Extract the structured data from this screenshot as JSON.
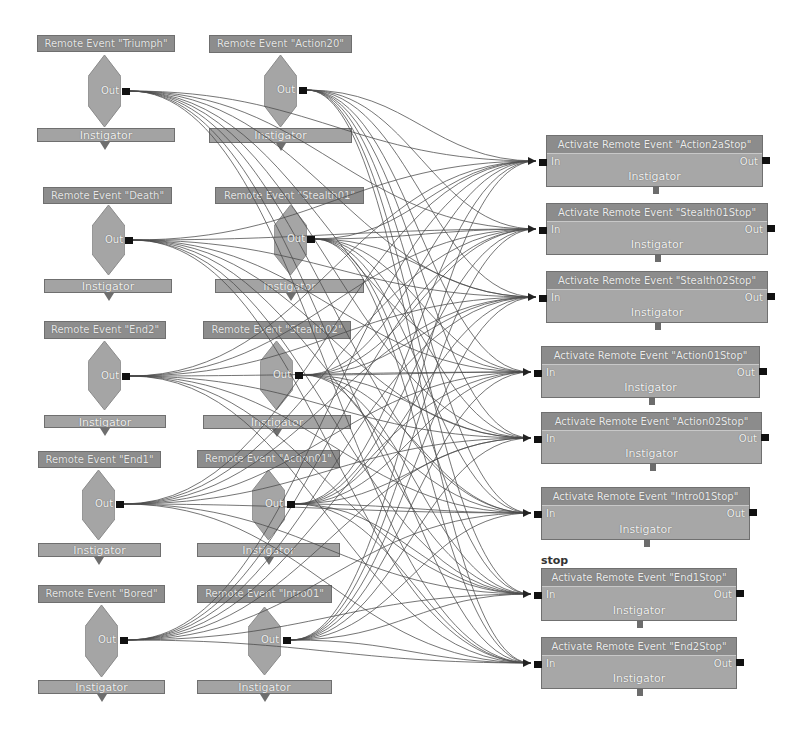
{
  "graph": {
    "source_nodes": [
      {
        "id": "triumph",
        "title": "Remote Event \"Triumph\"",
        "out_label": "Out",
        "instigator_label": "Instigator",
        "title_box": [
          37,
          35,
          138,
          17
        ],
        "inst_box": [
          37,
          128,
          138,
          14
        ],
        "diamond": [
          88,
          55,
          33,
          72
        ],
        "port": [
          122,
          88
        ]
      },
      {
        "id": "action20",
        "title": "Remote Event \"Action20\"",
        "out_label": "Out",
        "instigator_label": "Instigator",
        "title_box": [
          209,
          35,
          143,
          18
        ],
        "inst_box": [
          209,
          128,
          143,
          15
        ],
        "diamond": [
          264,
          55,
          33,
          72
        ],
        "port": [
          299,
          87
        ]
      },
      {
        "id": "death",
        "title": "Remote Event \"Death\"",
        "out_label": "Out",
        "instigator_label": "Instigator",
        "title_box": [
          43,
          187,
          129,
          17
        ],
        "inst_box": [
          44,
          279,
          128,
          14
        ],
        "diamond": [
          92,
          205,
          33,
          70
        ],
        "port": [
          125,
          237
        ]
      },
      {
        "id": "stealth01",
        "title": "Remote Event \"Stealth01\"",
        "out_label": "Out",
        "instigator_label": "Instigator",
        "title_box": [
          215,
          187,
          149,
          17
        ],
        "inst_box": [
          215,
          279,
          149,
          14
        ],
        "diamond": [
          274,
          205,
          33,
          70
        ],
        "port": [
          307,
          236
        ]
      },
      {
        "id": "end2",
        "title": "Remote Event \"End2\"",
        "out_label": "Out",
        "instigator_label": "Instigator",
        "title_box": [
          44,
          321,
          122,
          18
        ],
        "inst_box": [
          44,
          415,
          122,
          13
        ],
        "diamond": [
          88,
          341,
          33,
          69
        ],
        "port": [
          122,
          373
        ]
      },
      {
        "id": "stealth02",
        "title": "Remote Event \"Stealth02\"",
        "out_label": "Out",
        "instigator_label": "Instigator",
        "title_box": [
          203,
          321,
          148,
          18
        ],
        "inst_box": [
          203,
          415,
          148,
          14
        ],
        "diamond": [
          260,
          341,
          33,
          69
        ],
        "port": [
          295,
          372
        ]
      },
      {
        "id": "end1",
        "title": "Remote Event \"End1\"",
        "out_label": "Out",
        "instigator_label": "Instigator",
        "title_box": [
          38,
          451,
          123,
          17
        ],
        "inst_box": [
          38,
          543,
          123,
          14
        ],
        "diamond": [
          82,
          470,
          33,
          70
        ],
        "port": [
          116,
          501
        ]
      },
      {
        "id": "action01",
        "title": "Remote Event \"Action01\"",
        "out_label": "Out",
        "instigator_label": "Instigator",
        "title_box": [
          197,
          450,
          143,
          18
        ],
        "inst_box": [
          197,
          543,
          143,
          14
        ],
        "diamond": [
          252,
          470,
          33,
          70
        ],
        "port": [
          287,
          501
        ]
      },
      {
        "id": "bored",
        "title": "Remote Event \"Bored\"",
        "out_label": "Out",
        "instigator_label": "Instigator",
        "title_box": [
          38,
          585,
          127,
          18
        ],
        "inst_box": [
          38,
          680,
          127,
          14
        ],
        "diamond": [
          85,
          605,
          33,
          72
        ],
        "port": [
          120,
          637
        ]
      },
      {
        "id": "intro01",
        "title": "Remote Event \"Intro01\"",
        "out_label": "Out",
        "instigator_label": "Instigator",
        "title_box": [
          197,
          585,
          135,
          18
        ],
        "inst_box": [
          197,
          680,
          135,
          14
        ],
        "diamond": [
          248,
          607,
          33,
          68
        ],
        "port": [
          283,
          637
        ]
      }
    ],
    "target_nodes": [
      {
        "id": "action2astop",
        "title": "Activate Remote Event \"Action2aStop\"",
        "in_label": "In",
        "out_label": "Out",
        "instigator_label": "Instigator",
        "box": [
          546,
          135,
          217,
          52
        ]
      },
      {
        "id": "stealth01stop",
        "title": "Activate Remote Event \"Stealth01Stop\"",
        "in_label": "In",
        "out_label": "Out",
        "instigator_label": "Instigator",
        "box": [
          546,
          203,
          222,
          52
        ]
      },
      {
        "id": "stealth02stop",
        "title": "Activate Remote Event \"Stealth02Stop\"",
        "in_label": "In",
        "out_label": "Out",
        "instigator_label": "Instigator",
        "box": [
          546,
          271,
          222,
          52
        ]
      },
      {
        "id": "action01stop",
        "title": "Activate Remote Event \"Action01Stop\"",
        "in_label": "In",
        "out_label": "Out",
        "instigator_label": "Instigator",
        "box": [
          541,
          346,
          219,
          52
        ]
      },
      {
        "id": "action02stop",
        "title": "Activate Remote Event \"Action02Stop\"",
        "in_label": "In",
        "out_label": "Out",
        "instigator_label": "Instigator",
        "box": [
          541,
          412,
          221,
          52
        ]
      },
      {
        "id": "intro01stop",
        "title": "Activate Remote Event \"Intro01Stop\"",
        "in_label": "In",
        "out_label": "Out",
        "instigator_label": "Instigator",
        "box": [
          541,
          487,
          209,
          53
        ]
      },
      {
        "id": "end1stop",
        "title": "Activate Remote Event \"End1Stop\"",
        "in_label": "In",
        "out_label": "Out",
        "instigator_label": "Instigator",
        "box": [
          541,
          568,
          196,
          53
        ]
      },
      {
        "id": "end2stop",
        "title": "Activate Remote Event \"End2Stop\"",
        "in_label": "In",
        "out_label": "Out",
        "instigator_label": "Instigator",
        "box": [
          541,
          637,
          196,
          52
        ]
      }
    ],
    "comment_label": {
      "text": "stop",
      "pos": [
        541,
        554
      ]
    },
    "connections": "all source Out ports connect to every target In port"
  },
  "colors": {
    "wire": "#4a4a4a",
    "title_bg": "#8c8c8c",
    "body_bg": "#a7a7a7",
    "diamond": "#a5a5a5",
    "port": "#111111",
    "background": "#ffffff"
  }
}
